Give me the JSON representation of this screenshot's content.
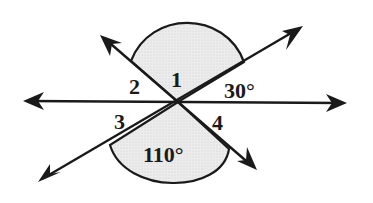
{
  "diagram": {
    "labels": {
      "angle1": "1",
      "angle2": "2",
      "angle3": "3",
      "angle4": "4",
      "angle_upper_right": "30°",
      "angle_lower": "110°"
    },
    "colors": {
      "stroke": "#1a1a1a",
      "shade": "#e4e4e4",
      "background": "#ffffff"
    }
  }
}
